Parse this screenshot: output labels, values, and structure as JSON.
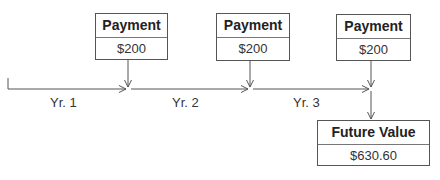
{
  "payments": [
    {
      "title": "Payment",
      "amount": "$200"
    },
    {
      "title": "Payment",
      "amount": "$200"
    },
    {
      "title": "Payment",
      "amount": "$200"
    }
  ],
  "periods": [
    {
      "label": "Yr. 1"
    },
    {
      "label": "Yr. 2"
    },
    {
      "label": "Yr. 3"
    }
  ],
  "future_value": {
    "title": "Future Value",
    "amount": "$630.60"
  },
  "colors": {
    "line": "#555555",
    "text": "#222222"
  }
}
